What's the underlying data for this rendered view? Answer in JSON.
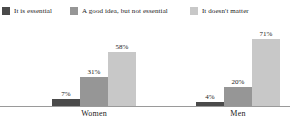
{
  "chart_data": {
    "type": "bar",
    "title": "",
    "subtitle": "",
    "xlabel": "",
    "ylabel": "",
    "ylim": [
      0,
      80
    ],
    "grid": false,
    "legend_position": "top",
    "categories": [
      "Women",
      "Men"
    ],
    "series": [
      {
        "name": "It is essential",
        "color": "#4a4a4a",
        "values": [
          7,
          4
        ],
        "labels": [
          "7%",
          "4%"
        ]
      },
      {
        "name": "A good idea, but not essential",
        "color": "#969696",
        "values": [
          31,
          20
        ],
        "labels": [
          "31%",
          "20%"
        ]
      },
      {
        "name": "It doesn't matter",
        "color": "#c8c8c8",
        "values": [
          58,
          71
        ],
        "labels": [
          "58%",
          "71%"
        ]
      }
    ]
  },
  "legend": {
    "items": [
      {
        "label": "It is essential",
        "color": "#4a4a4a"
      },
      {
        "label": "A good idea, but not essential",
        "color": "#969696"
      },
      {
        "label": "It doesn't matter",
        "color": "#c8c8c8"
      }
    ]
  },
  "axis": {
    "group_labels": [
      "Women",
      "Men"
    ],
    "baseline_color": "#9a9a9a"
  }
}
